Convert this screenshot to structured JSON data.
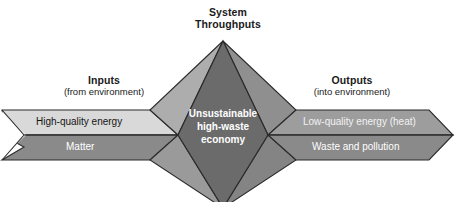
{
  "figure": {
    "headers": [
      {
        "id": "throughputs",
        "title": "System",
        "subtitle": "Throughputs"
      },
      {
        "id": "inputs",
        "title": "Inputs",
        "subtitle": "(from environment)"
      },
      {
        "id": "outputs",
        "title": "Outputs",
        "subtitle": "(into environment)"
      }
    ],
    "input_arrow": {
      "bands": [
        {
          "id": "high-quality-energy",
          "label": "High-quality energy",
          "fill": "#d9d9d9",
          "text_color": "#141414"
        },
        {
          "id": "matter",
          "label": "Matter",
          "fill": "#8a8a8a",
          "text_color": "#ffffff"
        }
      ]
    },
    "output_arrow": {
      "bands": [
        {
          "id": "low-quality-energy",
          "label": "Low-quality energy (heat)",
          "fill": "#9d9d9d",
          "text_color": "#f2f2f2"
        },
        {
          "id": "waste-and-pollution",
          "label": "Waste and pollution",
          "fill": "#8a8a8a",
          "text_color": "#ffffff"
        }
      ]
    },
    "core": {
      "id": "unsustainable-high-waste-economy",
      "line1": "Unsustainable",
      "line2": "high-waste",
      "line3": "economy",
      "fill": "#6b6b6b",
      "text_color": "#ffffff",
      "facet_upper_left": "#adadad",
      "facet_upper_right": "#8f8f8f",
      "facet_lower_left": "#9a9a9a",
      "facet_lower_right": "#848484"
    },
    "colors": {
      "background": "#ffffff",
      "outline": "#2b2b2b",
      "text_dark": "#1a1a1a"
    }
  }
}
